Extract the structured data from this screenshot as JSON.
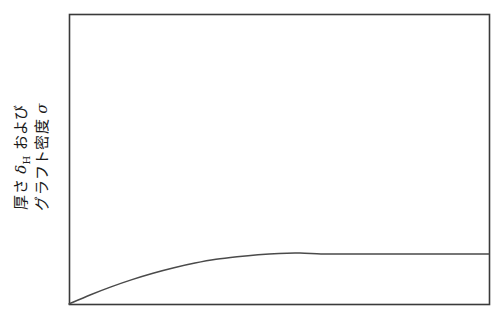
{
  "figure": {
    "background_color": "#ffffff",
    "frame_color": "#3a3a3a",
    "curve_color": "#4a4a4a"
  },
  "axis_label": {
    "line1_prefix": "厚さ ",
    "line1_symbol": "δ",
    "line1_subscript": "H",
    "line1_suffix": " および",
    "line2_prefix": "グラフト密度 ",
    "line2_symbol": "σ",
    "full_text": "厚さ δH および グラフト密度 σ"
  },
  "chart_data": {
    "type": "line",
    "title": "",
    "xlabel": "",
    "ylabel": "厚さ δH および グラフト密度 σ",
    "xlim": [
      0,
      1
    ],
    "ylim": [
      0,
      1
    ],
    "grid": false,
    "legend": null,
    "series": [
      {
        "name": "saturating-curve",
        "x": [
          0.0,
          0.05,
          0.1,
          0.15,
          0.2,
          0.25,
          0.3,
          0.35,
          0.4,
          0.45,
          0.5,
          0.55,
          0.6,
          0.65,
          0.7,
          0.75,
          0.8,
          0.85,
          0.9,
          0.95,
          1.0
        ],
        "y": [
          0.0,
          0.031,
          0.059,
          0.084,
          0.106,
          0.125,
          0.141,
          0.154,
          0.163,
          0.17,
          0.1745,
          0.1755,
          0.1725,
          0.1725,
          0.1725,
          0.1725,
          0.1725,
          0.1725,
          0.1725,
          0.1725,
          0.1725
        ]
      }
    ],
    "axis_ticks": {
      "x_ticks": [],
      "y_ticks": [],
      "x_tick_labels": [],
      "y_tick_labels": []
    }
  },
  "geometry": {
    "frame_left": 69,
    "frame_top": 14,
    "frame_right": 489,
    "frame_bottom": 304,
    "plateau_y": 254
  }
}
